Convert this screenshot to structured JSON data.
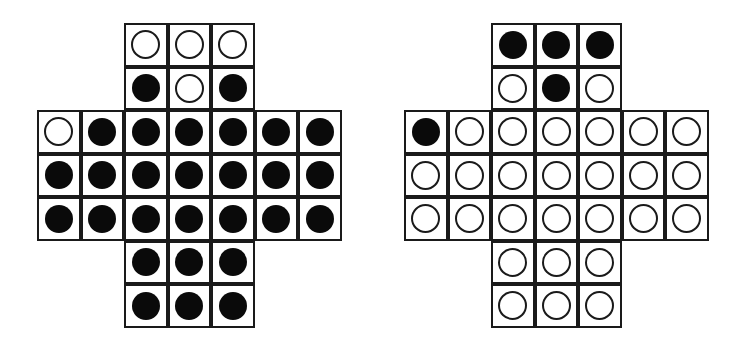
{
  "boards": [
    {
      "name": "board-left",
      "description": "Peg solitaire starting-like position",
      "layout": "english-cross-7x7",
      "legend": {
        "1": "filled-peg",
        "0": "empty-hole",
        "-1": "off-board"
      },
      "grid": [
        [
          -1,
          -1,
          0,
          0,
          0,
          -1,
          -1
        ],
        [
          -1,
          -1,
          1,
          0,
          1,
          -1,
          -1
        ],
        [
          0,
          1,
          1,
          1,
          1,
          1,
          1
        ],
        [
          1,
          1,
          1,
          1,
          1,
          1,
          1
        ],
        [
          1,
          1,
          1,
          1,
          1,
          1,
          1
        ],
        [
          -1,
          -1,
          1,
          1,
          1,
          -1,
          -1
        ],
        [
          -1,
          -1,
          1,
          1,
          1,
          -1,
          -1
        ]
      ]
    },
    {
      "name": "board-right",
      "description": "Peg solitaire complementary position",
      "layout": "english-cross-7x7",
      "legend": {
        "1": "filled-peg",
        "0": "empty-hole",
        "-1": "off-board"
      },
      "grid": [
        [
          -1,
          -1,
          1,
          1,
          1,
          -1,
          -1
        ],
        [
          -1,
          -1,
          0,
          1,
          0,
          -1,
          -1
        ],
        [
          1,
          0,
          0,
          0,
          0,
          0,
          0
        ],
        [
          0,
          0,
          0,
          0,
          0,
          0,
          0
        ],
        [
          0,
          0,
          0,
          0,
          0,
          0,
          0
        ],
        [
          -1,
          -1,
          0,
          0,
          0,
          -1,
          -1
        ],
        [
          -1,
          -1,
          0,
          0,
          0,
          -1,
          -1
        ]
      ]
    }
  ],
  "colors": {
    "peg_filled": "#0a0a0a",
    "grid_line": "#1a1a1a",
    "background": "#ffffff"
  }
}
